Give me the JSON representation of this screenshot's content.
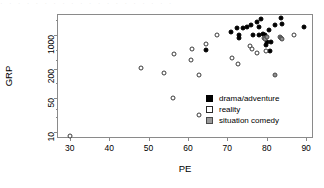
{
  "top_artifact_text": "· · ·   · · ·   · · · · ·   · ·   · · ·   · · · ·",
  "chart_data": {
    "type": "scatter",
    "title": "",
    "xlabel": "PE",
    "ylabel": "GRP",
    "xlim": [
      27,
      92
    ],
    "ylim_log": [
      7,
      2600
    ],
    "yscale": "log",
    "xscale": "linear",
    "grid": false,
    "xticks": [
      30,
      40,
      50,
      60,
      70,
      80,
      90
    ],
    "xtick_labels": [
      "30",
      "40",
      "50",
      "60",
      "70",
      "80",
      "90"
    ],
    "yticks": [
      10,
      50,
      200,
      1000
    ],
    "ytick_labels": [
      "10",
      "50",
      "200",
      "1000"
    ],
    "ytick_minor": [
      20,
      30,
      100,
      300,
      500,
      2000
    ],
    "legend_position": "bottom-right-inside",
    "series": [
      {
        "name": "drama/adventure",
        "marker": "filled-circle",
        "color": "#000000",
        "points": [
          [
            71.0,
            1180
          ],
          [
            72.5,
            1380
          ],
          [
            73.0,
            880
          ],
          [
            74.0,
            1400
          ],
          [
            75.0,
            1450
          ],
          [
            76.0,
            1600
          ],
          [
            76.5,
            1020
          ],
          [
            77.5,
            1900
          ],
          [
            78.0,
            1500
          ],
          [
            78.5,
            2100
          ],
          [
            79.0,
            1060
          ],
          [
            79.5,
            1010
          ],
          [
            79.8,
            620
          ],
          [
            80.5,
            1250
          ],
          [
            80.8,
            460
          ],
          [
            81.0,
            700
          ],
          [
            82.0,
            1600
          ],
          [
            83.5,
            2300
          ],
          [
            84.0,
            1700
          ],
          [
            89.5,
            1450
          ],
          [
            64.5,
            480
          ],
          [
            73.0,
            990
          ],
          [
            78.0,
            980
          ],
          [
            80.0,
            700
          ]
        ]
      },
      {
        "name": "reality",
        "marker": "open-circle",
        "color": "#ffffff",
        "points": [
          [
            30.0,
            8
          ],
          [
            48.0,
            205
          ],
          [
            54.0,
            165
          ],
          [
            56.3,
            50
          ],
          [
            56.5,
            400
          ],
          [
            60.8,
            300
          ],
          [
            61.0,
            520
          ],
          [
            62.7,
            22
          ],
          [
            62.8,
            145
          ],
          [
            64.5,
            640
          ],
          [
            67.3,
            980
          ],
          [
            71.3,
            330
          ],
          [
            72.8,
            250
          ],
          [
            75.8,
            600
          ],
          [
            76.3,
            520
          ],
          [
            77.5,
            420
          ],
          [
            79.8,
            470
          ],
          [
            86.8,
            980
          ]
        ]
      },
      {
        "name": "situation comedy",
        "marker": "gray-circle",
        "color": "#8f8f8f",
        "points": [
          [
            79.2,
            880
          ],
          [
            79.6,
            830
          ],
          [
            80.0,
            900
          ],
          [
            83.3,
            930
          ],
          [
            83.6,
            880
          ],
          [
            84.0,
            840
          ],
          [
            82.2,
            150
          ]
        ]
      }
    ]
  },
  "legend": {
    "entries": [
      {
        "label": "drama/adventure",
        "key": "drama"
      },
      {
        "label": "reality",
        "key": "reality"
      },
      {
        "label": "situation comedy",
        "key": "sitcom"
      }
    ]
  }
}
